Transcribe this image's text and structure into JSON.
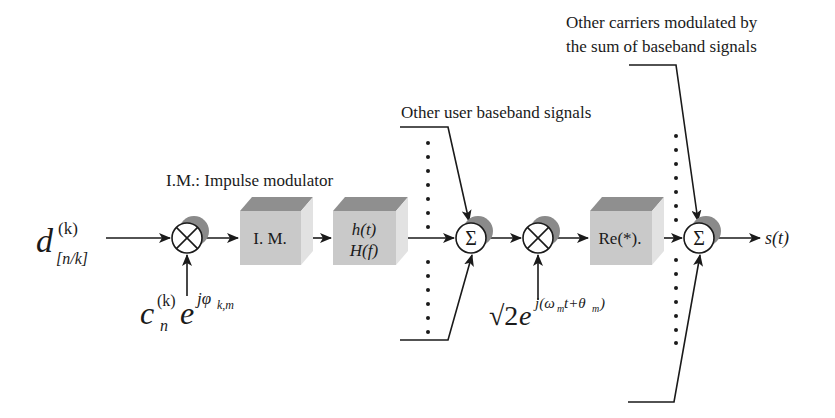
{
  "diagram": {
    "type": "signal-flow block diagram",
    "colors": {
      "line": "#1a1a1a",
      "block_front": "#c9c9c9",
      "block_top": "#8f8f8f",
      "block_side": "#e2e2e2",
      "node_shadow": "#8a8a8a",
      "background": "#ffffff"
    },
    "annotations": {
      "impulse_modulator_legend": "I.M.: Impulse modulator",
      "other_user_signals": "Other user baseband signals",
      "other_carriers_line1": "Other carriers modulated by",
      "other_carriers_line2": "the sum of baseband signals"
    },
    "input": {
      "symbol": "d",
      "superscript": "(k)",
      "subscript": "[n/k]"
    },
    "spreading_code": {
      "c": "c",
      "c_sub": "n",
      "c_sup": "(k)",
      "e": "e",
      "exp": "jφ",
      "exp_sub": "k,m"
    },
    "carrier": {
      "sqrt": "√2",
      "e": "e",
      "exp": "j(ω",
      "exp_sub1": "m",
      "exp_mid": "t+θ",
      "exp_sub2": "m",
      "exp_end": ")"
    },
    "blocks": [
      {
        "id": "im",
        "label": "I. M."
      },
      {
        "id": "filter",
        "label_line1": "h(t)",
        "label_line2": "H(f)"
      },
      {
        "id": "real",
        "label": "Re(*)."
      }
    ],
    "nodes": [
      {
        "id": "mult1",
        "type": "multiplier",
        "glyph": "×"
      },
      {
        "id": "sum1",
        "type": "summer",
        "glyph": "Σ"
      },
      {
        "id": "mult2",
        "type": "multiplier",
        "glyph": "×"
      },
      {
        "id": "sum2",
        "type": "summer",
        "glyph": "Σ"
      }
    ],
    "output": {
      "label": "s(t)"
    }
  }
}
